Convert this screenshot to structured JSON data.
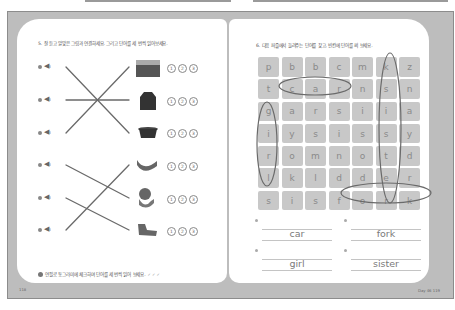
{
  "left_page": {
    "instruction": "5. 잘 듣고 알맞은 그림과 연결하세요. 그리고 단어를 세 번씩 읽어보세요.",
    "rows": [
      {
        "index": 1,
        "speaker_icon": "speaker-icon",
        "picture": "sister-card",
        "circles": [
          "1",
          "2",
          "3"
        ]
      },
      {
        "index": 2,
        "speaker_icon": "speaker-icon",
        "picture": "coat",
        "circles": [
          "1",
          "2",
          "3"
        ]
      },
      {
        "index": 3,
        "speaker_icon": "speaker-icon",
        "picture": "pot",
        "circles": [
          "1",
          "2",
          "3"
        ]
      },
      {
        "index": 4,
        "speaker_icon": "speaker-icon",
        "picture": "arm",
        "circles": [
          "1",
          "2",
          "3"
        ]
      },
      {
        "index": 5,
        "speaker_icon": "speaker-icon",
        "picture": "girl-drinking",
        "circles": [
          "1",
          "2",
          "3"
        ]
      },
      {
        "index": 6,
        "speaker_icon": "speaker-icon",
        "picture": "sock",
        "circles": [
          "1",
          "2",
          "3"
        ]
      }
    ],
    "connections": [
      [
        1,
        3
      ],
      [
        2,
        2
      ],
      [
        3,
        1
      ],
      [
        4,
        5
      ],
      [
        5,
        6
      ],
      [
        6,
        4
      ]
    ],
    "footer_note": "연필로 동그라미에 체크하며 단어를 세 번씩 읽어 보세요.",
    "footer_checks": [
      "✓",
      "✓",
      "✓"
    ],
    "page_number": "118"
  },
  "right_page": {
    "instruction": "6. 다음 퍼즐에서 들려주는 단어를 찾고, 빈칸에 단어를 써 보세요.",
    "grid": [
      [
        "p",
        "b",
        "b",
        "c",
        "m",
        "k",
        "z"
      ],
      [
        "t",
        "c",
        "a",
        "r",
        "n",
        "s",
        "n"
      ],
      [
        "g",
        "a",
        "r",
        "s",
        "i",
        "i",
        "a"
      ],
      [
        "i",
        "y",
        "s",
        "i",
        "s",
        "s",
        "y"
      ],
      [
        "r",
        "o",
        "m",
        "n",
        "o",
        "t",
        "d"
      ],
      [
        "l",
        "k",
        "l",
        "d",
        "d",
        "e",
        "r"
      ],
      [
        "s",
        "i",
        "s",
        "f",
        "o",
        "r",
        "k"
      ]
    ],
    "answers": [
      "car",
      "fork",
      "girl",
      "sister"
    ],
    "page_number": "Day 46  119"
  },
  "colors": {
    "frame": "#bdbdbd",
    "cell": "#c8c8c8",
    "ink": "#6a6a6a"
  }
}
